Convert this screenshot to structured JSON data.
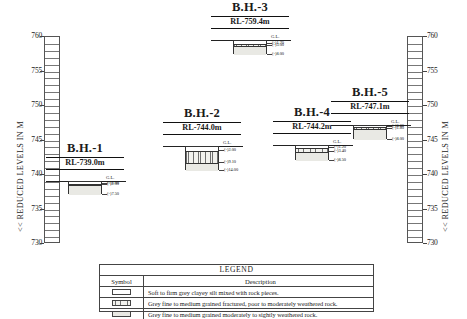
{
  "axis": {
    "title_left": "<< REDUCED LEVELS IN M",
    "title_right": "<< REDUCED LEVELS IN M",
    "ticks": [
      "760",
      "755",
      "750",
      "745",
      "740",
      "735",
      "730"
    ],
    "min": 730,
    "max": 760,
    "unit": "m"
  },
  "ground_level_label": "G.L.",
  "boreholes": [
    {
      "name": "B.H.-1",
      "rl_label": "RL-739.0m",
      "rl": 739.0,
      "layers": [
        {
          "pattern": "silt",
          "from": 0.0,
          "to": 1.0
        },
        {
          "pattern": "frac",
          "from": 1.0,
          "to": 2.0
        },
        {
          "pattern": "weath",
          "from": 2.0,
          "to": 7.5
        }
      ],
      "depth_labels": [
        {
          "text": "(-)1.00",
          "depth": 1.0
        },
        {
          "text": "(-)2.00",
          "depth": 2.0
        },
        {
          "text": "(-)7.50",
          "depth": 7.5
        }
      ]
    },
    {
      "name": "B.H.-2",
      "rl_label": "RL-744.0m",
      "rl": 744.0,
      "layers": [
        {
          "pattern": "silt",
          "from": 0.0,
          "to": 2.0
        },
        {
          "pattern": "frac",
          "from": 2.0,
          "to": 9.1
        },
        {
          "pattern": "weath",
          "from": 9.1,
          "to": 14.0
        }
      ],
      "depth_labels": [
        {
          "text": "(-)2.00",
          "depth": 2.0
        },
        {
          "text": "(-)9.10",
          "depth": 9.1
        },
        {
          "text": "(-)14.00",
          "depth": 14.0
        }
      ]
    },
    {
      "name": "B.H.-3",
      "rl_label": "RL-759.4m",
      "rl": 759.4,
      "layers": [
        {
          "pattern": "silt",
          "from": 0.0,
          "to": 1.7
        },
        {
          "pattern": "frac",
          "from": 1.7,
          "to": 3.0
        },
        {
          "pattern": "weath",
          "from": 3.0,
          "to": 8.0
        }
      ],
      "depth_labels": [
        {
          "text": "(-)1.70",
          "depth": 1.7
        },
        {
          "text": "(-)3.00",
          "depth": 3.0
        },
        {
          "text": "(-)8.00",
          "depth": 8.0
        }
      ]
    },
    {
      "name": "B.H.-4",
      "rl_label": "RL-744.2m",
      "rl": 744.2,
      "layers": [
        {
          "pattern": "silt",
          "from": 0.0,
          "to": 1.2
        },
        {
          "pattern": "frac",
          "from": 1.2,
          "to": 3.4
        },
        {
          "pattern": "weath",
          "from": 3.4,
          "to": 8.5
        }
      ],
      "depth_labels": [
        {
          "text": "(-)1.20",
          "depth": 1.2
        },
        {
          "text": "(-)3.40",
          "depth": 3.4
        },
        {
          "text": "(-)8.50",
          "depth": 8.5
        }
      ]
    },
    {
      "name": "B.H.-5",
      "rl_label": "RL-747.1m",
      "rl": 747.1,
      "layers": [
        {
          "pattern": "silt",
          "from": 0.0,
          "to": 0.6
        },
        {
          "pattern": "frac",
          "from": 0.6,
          "to": 1.8
        },
        {
          "pattern": "weath",
          "from": 1.8,
          "to": 8.0
        }
      ],
      "depth_labels": [
        {
          "text": "(-)0.60",
          "depth": 0.6
        },
        {
          "text": "(-)1.80",
          "depth": 1.8
        },
        {
          "text": "(-)8.00",
          "depth": 8.0
        }
      ]
    }
  ],
  "legend": {
    "title": "LEGEND",
    "col_symbol": "Symbol",
    "col_description": "Description",
    "rows": [
      {
        "pattern": "silt",
        "description": "Soft to firm grey clayey silt mixed with rock pieces."
      },
      {
        "pattern": "frac",
        "description": "Grey fine to medium grained fractured, poor to moderately weathered rock."
      },
      {
        "pattern": "weath",
        "description": "Grey fine to medium grained moderately to sightly weathered rock."
      }
    ]
  }
}
